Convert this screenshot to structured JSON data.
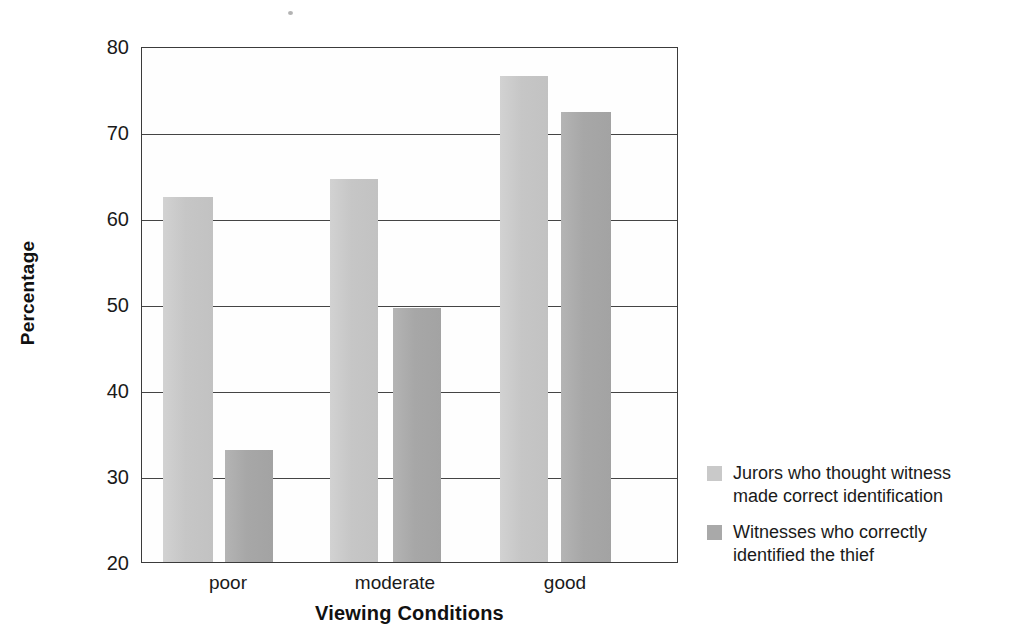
{
  "chart_data": {
    "type": "bar",
    "title": "",
    "xlabel": "Viewing Conditions",
    "ylabel": "Percentage",
    "categories": [
      "poor",
      "moderate",
      "good"
    ],
    "ylim": [
      20,
      80
    ],
    "yticks": [
      20,
      30,
      40,
      50,
      60,
      70,
      80
    ],
    "ytick_labels": [
      "20",
      "30",
      "40",
      "50",
      "60",
      "70",
      "80"
    ],
    "grid": true,
    "legend_position": "right",
    "series": [
      {
        "name": "Jurors who thought witness made correct identification",
        "name_line1": "Jurors who thought witness",
        "name_line2": "made correct identification",
        "color": "#c8c8c8",
        "values": [
          62.5,
          64.5,
          76.5
        ]
      },
      {
        "name": "Witnesses who correctly identified the thief",
        "name_line1": "Witnesses who correctly",
        "name_line2": "identified the thief",
        "color": "#a8a8a8",
        "values": [
          33.0,
          49.5,
          72.3
        ]
      }
    ]
  },
  "legend": {
    "items": [
      {
        "label": "Jurors who thought witness\nmade correct identification",
        "swatch": "light"
      },
      {
        "label": "Witnesses who correctly\nidentified the thief",
        "swatch": "dark"
      }
    ]
  },
  "axes": {
    "y_title": "Percentage",
    "x_title": "Viewing Conditions",
    "y_ticks": [
      "80",
      "70",
      "60",
      "50",
      "40",
      "30",
      "20"
    ],
    "x_ticks": [
      "poor",
      "moderate",
      "good"
    ]
  }
}
